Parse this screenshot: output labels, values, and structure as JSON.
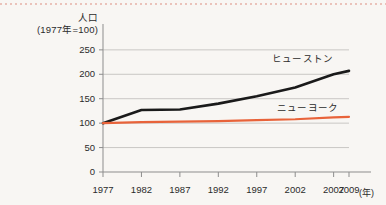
{
  "figure": {
    "background_color": "#f8f6f3",
    "top_rule": "dotted-pink-rule"
  },
  "axis": {
    "y_title_main": "人口",
    "y_title_base": "(1977年=100)",
    "x_unit": "(年)"
  },
  "chart_data": {
    "type": "line",
    "title": "",
    "xlabel": "(年)",
    "ylabel": "人口 (1977年=100)",
    "x": [
      1977,
      1982,
      1987,
      1992,
      1997,
      2002,
      2007,
      2009
    ],
    "xtick_labels": [
      "1977",
      "1982",
      "1987",
      "1992",
      "1997",
      "2002",
      "2007",
      "2009"
    ],
    "ytick_labels": [
      "0",
      "50",
      "100",
      "150",
      "200",
      "250"
    ],
    "yticks": [
      0,
      50,
      100,
      150,
      200,
      250
    ],
    "ylim": [
      0,
      262
    ],
    "xlim": [
      1977,
      2009
    ],
    "grid": true,
    "legend": "inline-labels",
    "series": [
      {
        "name": "ヒューストン",
        "color": "#1a1a1a",
        "width": 2.6,
        "values": [
          100,
          127,
          128,
          140,
          155,
          173,
          200,
          207
        ]
      },
      {
        "name": "ニューヨーク",
        "color": "#e8633a",
        "width": 2.2,
        "values": [
          100,
          102,
          103,
          104,
          106,
          108,
          112,
          113
        ]
      }
    ]
  }
}
